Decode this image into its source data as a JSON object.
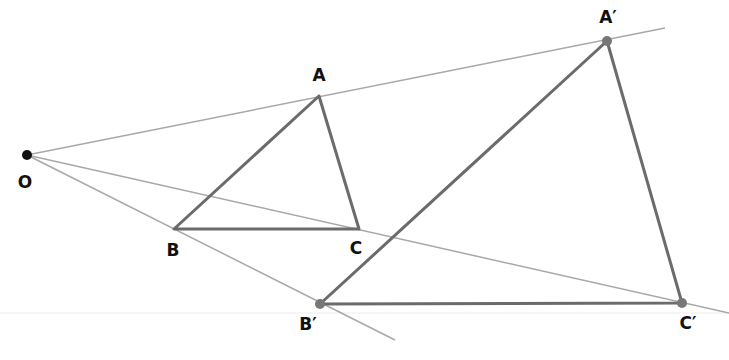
{
  "colors": {
    "ray": "#a8a8a8",
    "triangle": "#6b6b6b",
    "center_point": "#111111",
    "image_point": "#777777",
    "baseline": "#ececec",
    "label": "#111111"
  },
  "points": {
    "O": {
      "label": "O",
      "x": 27,
      "y": 155,
      "lx": 25,
      "ly": 182
    },
    "A": {
      "label": "A",
      "x": 319,
      "y": 96,
      "lx": 319,
      "ly": 75
    },
    "B": {
      "label": "B",
      "x": 174,
      "y": 229,
      "lx": 173,
      "ly": 250
    },
    "C": {
      "label": "C",
      "x": 359,
      "y": 229,
      "lx": 356,
      "ly": 248
    },
    "A_prime": {
      "label": "A′",
      "x": 607,
      "y": 41,
      "lx": 608,
      "ly": 17
    },
    "B_prime": {
      "label": "B′",
      "x": 320,
      "y": 304,
      "lx": 308,
      "ly": 324
    },
    "C_prime": {
      "label": "C′",
      "x": 682,
      "y": 303,
      "lx": 688,
      "ly": 323
    }
  },
  "rays": [
    {
      "name": "ray-OA",
      "x1": 27,
      "y1": 155,
      "x2": 665,
      "y2": 28
    },
    {
      "name": "ray-OC",
      "x1": 27,
      "y1": 155,
      "x2": 729,
      "y2": 313
    },
    {
      "name": "ray-OB",
      "x1": 27,
      "y1": 155,
      "x2": 395,
      "y2": 340
    }
  ],
  "baseline": {
    "x1": 0,
    "y1": 313,
    "x2": 729,
    "y2": 313
  },
  "triangles": {
    "original": [
      "A",
      "B",
      "C"
    ],
    "image": [
      "A_prime",
      "B_prime",
      "C_prime"
    ]
  }
}
